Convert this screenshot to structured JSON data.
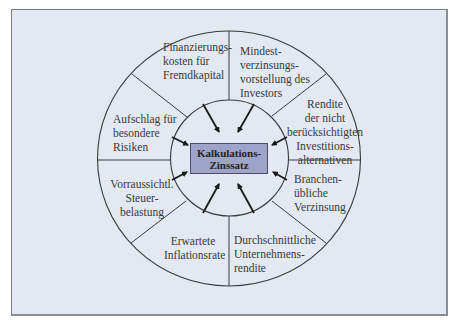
{
  "diagram": {
    "center": {
      "label": "Kalkulations-\nZinssatz",
      "fill": "#9ea4c8"
    },
    "segments": [
      {
        "id": "finanzierungskosten",
        "label": "Finanzierungs-\nkosten für\nFremdkapital"
      },
      {
        "id": "mindestverzinsung",
        "label": "Mindest-\nverzinsungs-\nvorstellung des\nInvestors"
      },
      {
        "id": "rendite-alternativen",
        "label": "Rendite\nder nicht\nberücksichtigten\nInvestitions-\nalternativen"
      },
      {
        "id": "branchenuebliche-verzinsung",
        "label": "Branchen-\nübliche\nVerzinsung"
      },
      {
        "id": "unternehmensrendite",
        "label": "Durchschnittliche\nUnternehmens-\nrendite"
      },
      {
        "id": "inflationsrate",
        "label": "Erwartete\nInflationsrate"
      },
      {
        "id": "steuerbelastung",
        "label": "Vorraussichtl.\nSteuer-\nbelastung"
      },
      {
        "id": "risikoaufschlag",
        "label": "Aufschlag für\nbesondere\nRisiken"
      }
    ],
    "colors": {
      "background": "#e3e8f2",
      "lines": "#3a3a3a",
      "arrows": "#1a1a1a"
    }
  }
}
